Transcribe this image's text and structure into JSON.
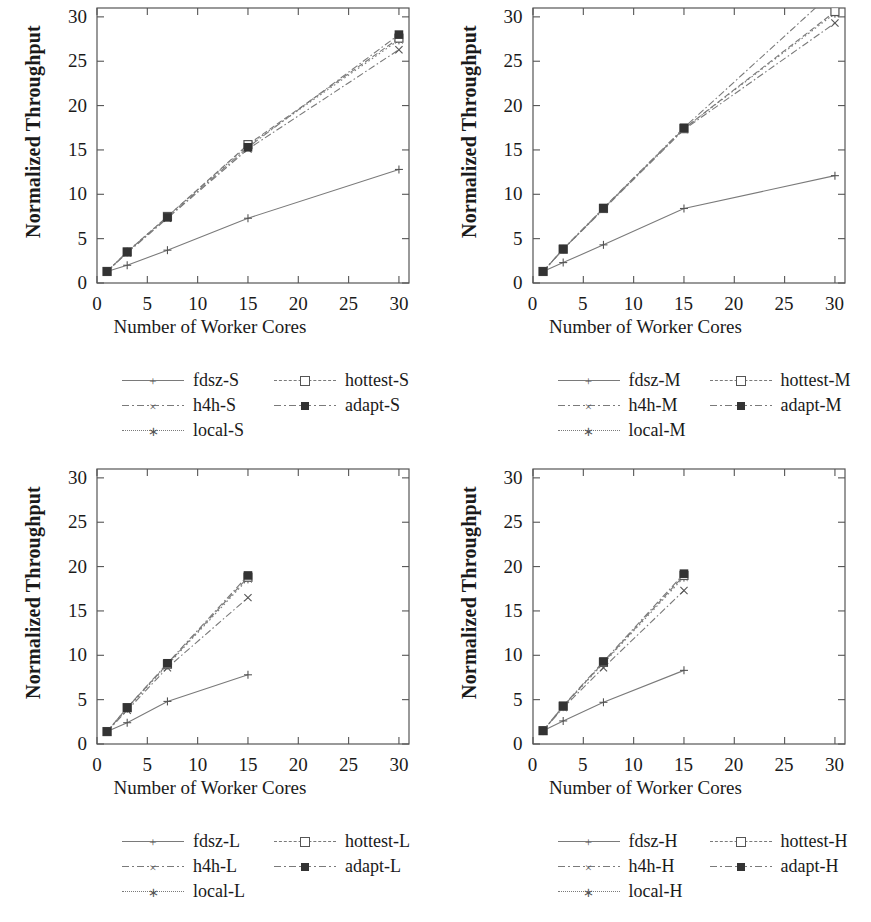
{
  "figure": {
    "panels": [
      "S",
      "M",
      "L",
      "H"
    ]
  },
  "axis": {
    "xlabel": "Number of Worker Cores",
    "ylabel": "Normalized Throughput",
    "xticks": [
      "0",
      "5",
      "10",
      "15",
      "20",
      "25",
      "30"
    ],
    "yticks": [
      "0",
      "5",
      "10",
      "15",
      "20",
      "25",
      "30"
    ]
  },
  "legend_marks": {
    "fdsz": "plus-marker",
    "h4h": "cross-marker",
    "local": "star-marker",
    "hottest": "open-square-marker",
    "adapt": "filled-square-marker"
  },
  "colors": {
    "line": "#7a7a7a",
    "frame": "#555555",
    "marker_fill": "#333333",
    "text": "#1a1a1a"
  },
  "chart_data": [
    {
      "type": "line",
      "id": "panel-s",
      "title": "",
      "xlabel": "Number of Worker Cores",
      "ylabel": "Normalized Throughput",
      "xlim": [
        0,
        31
      ],
      "ylim": [
        0,
        31
      ],
      "xticks": [
        0,
        5,
        10,
        15,
        20,
        25,
        30
      ],
      "yticks": [
        0,
        5,
        10,
        15,
        20,
        25,
        30
      ],
      "grid": false,
      "legend_position": "below",
      "x": [
        1,
        3,
        7,
        15,
        30
      ],
      "series": [
        {
          "name": "fdsz-S",
          "marker": "plus",
          "style": "solid",
          "values": [
            1.3,
            2.0,
            3.7,
            7.3,
            12.8
          ]
        },
        {
          "name": "h4h-S",
          "marker": "cross",
          "style": "dashdot",
          "values": [
            1.3,
            3.4,
            7.3,
            15.1,
            26.3
          ]
        },
        {
          "name": "local-S",
          "marker": "star",
          "style": "dotted",
          "values": [
            1.3,
            3.5,
            7.5,
            15.5,
            27.4
          ]
        },
        {
          "name": "hottest-S",
          "marker": "open-square",
          "style": "dashed",
          "values": [
            1.3,
            3.5,
            7.5,
            15.6,
            27.6
          ]
        },
        {
          "name": "adapt-S",
          "marker": "filled-square",
          "style": "dashdot",
          "values": [
            1.3,
            3.5,
            7.4,
            15.3,
            28.0
          ]
        }
      ]
    },
    {
      "type": "line",
      "id": "panel-m",
      "title": "",
      "xlabel": "Number of Worker Cores",
      "ylabel": "Normalized Throughput",
      "xlim": [
        0,
        31
      ],
      "ylim": [
        0,
        31
      ],
      "xticks": [
        0,
        5,
        10,
        15,
        20,
        25,
        30
      ],
      "yticks": [
        0,
        5,
        10,
        15,
        20,
        25,
        30
      ],
      "grid": false,
      "legend_position": "below",
      "x": [
        1,
        3,
        7,
        15,
        30
      ],
      "series": [
        {
          "name": "fdsz-M",
          "marker": "plus",
          "style": "solid",
          "values": [
            1.3,
            2.3,
            4.3,
            8.4,
            12.1
          ]
        },
        {
          "name": "h4h-M",
          "marker": "cross",
          "style": "dashdot",
          "values": [
            1.3,
            3.8,
            8.3,
            17.3,
            29.3
          ]
        },
        {
          "name": "local-M",
          "marker": "star",
          "style": "dotted",
          "values": [
            1.3,
            3.8,
            8.4,
            17.4,
            30.4
          ]
        },
        {
          "name": "hottest-M",
          "marker": "open-square",
          "style": "dashed",
          "values": [
            1.3,
            3.8,
            8.4,
            17.4,
            30.6
          ]
        },
        {
          "name": "adapt-M",
          "marker": "filled-square",
          "style": "dashdot",
          "values": [
            1.3,
            3.85,
            8.45,
            17.5,
            33.0
          ]
        }
      ]
    },
    {
      "type": "line",
      "id": "panel-l",
      "title": "",
      "xlabel": "Number of Worker Cores",
      "ylabel": "Normalized Throughput",
      "xlim": [
        0,
        31
      ],
      "ylim": [
        0,
        31
      ],
      "xticks": [
        0,
        5,
        10,
        15,
        20,
        25,
        30
      ],
      "yticks": [
        0,
        5,
        10,
        15,
        20,
        25,
        30
      ],
      "grid": false,
      "legend_position": "below",
      "x": [
        1,
        3,
        7,
        15
      ],
      "series": [
        {
          "name": "fdsz-L",
          "marker": "plus",
          "style": "solid",
          "values": [
            1.4,
            2.4,
            4.8,
            7.8
          ]
        },
        {
          "name": "h4h-L",
          "marker": "cross",
          "style": "dashdot",
          "values": [
            1.4,
            3.8,
            8.6,
            16.5
          ]
        },
        {
          "name": "local-L",
          "marker": "star",
          "style": "dotted",
          "values": [
            1.4,
            4.0,
            8.9,
            18.6
          ]
        },
        {
          "name": "hottest-L",
          "marker": "open-square",
          "style": "dashed",
          "values": [
            1.4,
            4.1,
            9.0,
            18.8
          ]
        },
        {
          "name": "adapt-L",
          "marker": "filled-square",
          "style": "dashdot",
          "values": [
            1.4,
            4.1,
            9.1,
            19.0
          ]
        }
      ]
    },
    {
      "type": "line",
      "id": "panel-h",
      "title": "",
      "xlabel": "Number of Worker Cores",
      "ylabel": "Normalized Throughput",
      "xlim": [
        0,
        31
      ],
      "ylim": [
        0,
        31
      ],
      "xticks": [
        0,
        5,
        10,
        15,
        20,
        25,
        30
      ],
      "yticks": [
        0,
        5,
        10,
        15,
        20,
        25,
        30
      ],
      "grid": false,
      "legend_position": "below",
      "x": [
        1,
        3,
        7,
        15
      ],
      "series": [
        {
          "name": "fdsz-H",
          "marker": "plus",
          "style": "solid",
          "values": [
            1.5,
            2.6,
            4.7,
            8.3
          ]
        },
        {
          "name": "h4h-H",
          "marker": "cross",
          "style": "dashdot",
          "values": [
            1.5,
            4.1,
            8.6,
            17.3
          ]
        },
        {
          "name": "local-H",
          "marker": "star",
          "style": "dotted",
          "values": [
            1.5,
            4.2,
            9.1,
            18.8
          ]
        },
        {
          "name": "hottest-H",
          "marker": "open-square",
          "style": "dashed",
          "values": [
            1.5,
            4.25,
            9.2,
            19.0
          ]
        },
        {
          "name": "adapt-H",
          "marker": "filled-square",
          "style": "dashdot",
          "values": [
            1.5,
            4.3,
            9.3,
            19.2
          ]
        }
      ]
    }
  ],
  "legends": [
    {
      "id": "legend-s",
      "rows": [
        [
          {
            "label": "fdsz-S",
            "marker": "plus",
            "style": "solid"
          },
          {
            "label": "hottest-S",
            "marker": "open-square",
            "style": "dashed"
          }
        ],
        [
          {
            "label": "h4h-S",
            "marker": "cross",
            "style": "dashdot"
          },
          {
            "label": "adapt-S",
            "marker": "filled-square",
            "style": "dashdot"
          }
        ],
        [
          {
            "label": "local-S",
            "marker": "star",
            "style": "dotted"
          }
        ]
      ]
    },
    {
      "id": "legend-m",
      "rows": [
        [
          {
            "label": "fdsz-M",
            "marker": "plus",
            "style": "solid"
          },
          {
            "label": "hottest-M",
            "marker": "open-square",
            "style": "dashed"
          }
        ],
        [
          {
            "label": "h4h-M",
            "marker": "cross",
            "style": "dashdot"
          },
          {
            "label": "adapt-M",
            "marker": "filled-square",
            "style": "dashdot"
          }
        ],
        [
          {
            "label": "local-M",
            "marker": "star",
            "style": "dotted"
          }
        ]
      ]
    },
    {
      "id": "legend-l",
      "rows": [
        [
          {
            "label": "fdsz-L",
            "marker": "plus",
            "style": "solid"
          },
          {
            "label": "hottest-L",
            "marker": "open-square",
            "style": "dashed"
          }
        ],
        [
          {
            "label": "h4h-L",
            "marker": "cross",
            "style": "dashdot"
          },
          {
            "label": "adapt-L",
            "marker": "filled-square",
            "style": "dashdot"
          }
        ],
        [
          {
            "label": "local-L",
            "marker": "star",
            "style": "dotted"
          }
        ]
      ]
    },
    {
      "id": "legend-h",
      "rows": [
        [
          {
            "label": "fdsz-H",
            "marker": "plus",
            "style": "solid"
          },
          {
            "label": "hottest-H",
            "marker": "open-square",
            "style": "dashed"
          }
        ],
        [
          {
            "label": "h4h-H",
            "marker": "cross",
            "style": "dashdot"
          },
          {
            "label": "adapt-H",
            "marker": "filled-square",
            "style": "dashdot"
          }
        ],
        [
          {
            "label": "local-H",
            "marker": "star",
            "style": "dotted"
          }
        ]
      ]
    }
  ]
}
